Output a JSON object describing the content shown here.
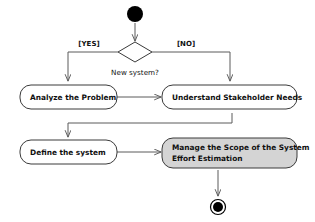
{
  "diagram": {
    "type": "uml-activity-diagram",
    "colors": {
      "background": "#ffffff",
      "node_stroke": "#3a3a3a",
      "flow_line": "#5a5a5a",
      "text": "#101010",
      "highlight_fill": "#d4d4d4",
      "terminal_fill": "#000000"
    },
    "nodes": {
      "start": {
        "name": "initial-node",
        "shape": "filled-circle"
      },
      "decision": {
        "name": "decision-node",
        "shape": "diamond",
        "label": "New system?"
      },
      "analyze": {
        "name": "activity-analyze-the-problem",
        "label": "Analyze the Problem"
      },
      "understand": {
        "name": "activity-understand-stakeholder-needs",
        "label": "Understand Stakeholder Needs"
      },
      "define": {
        "name": "activity-define-the-system",
        "label": "Define the system"
      },
      "manage": {
        "name": "activity-manage-scope",
        "label_line1": "Manage the Scope of the System",
        "label_line2": "Effort Estimation",
        "highlighted": true
      },
      "end": {
        "name": "final-node",
        "shape": "bullseye"
      }
    },
    "guards": {
      "yes": "[YES]",
      "no": "[NO]"
    },
    "edges": [
      {
        "from": "start",
        "to": "decision",
        "guard": ""
      },
      {
        "from": "decision",
        "to": "analyze",
        "guard": "[YES]"
      },
      {
        "from": "decision",
        "to": "understand",
        "guard": "[NO]"
      },
      {
        "from": "analyze",
        "to": "understand",
        "guard": ""
      },
      {
        "from": "understand",
        "to": "define",
        "guard": ""
      },
      {
        "from": "define",
        "to": "manage",
        "guard": ""
      },
      {
        "from": "manage",
        "to": "end",
        "guard": ""
      }
    ]
  }
}
